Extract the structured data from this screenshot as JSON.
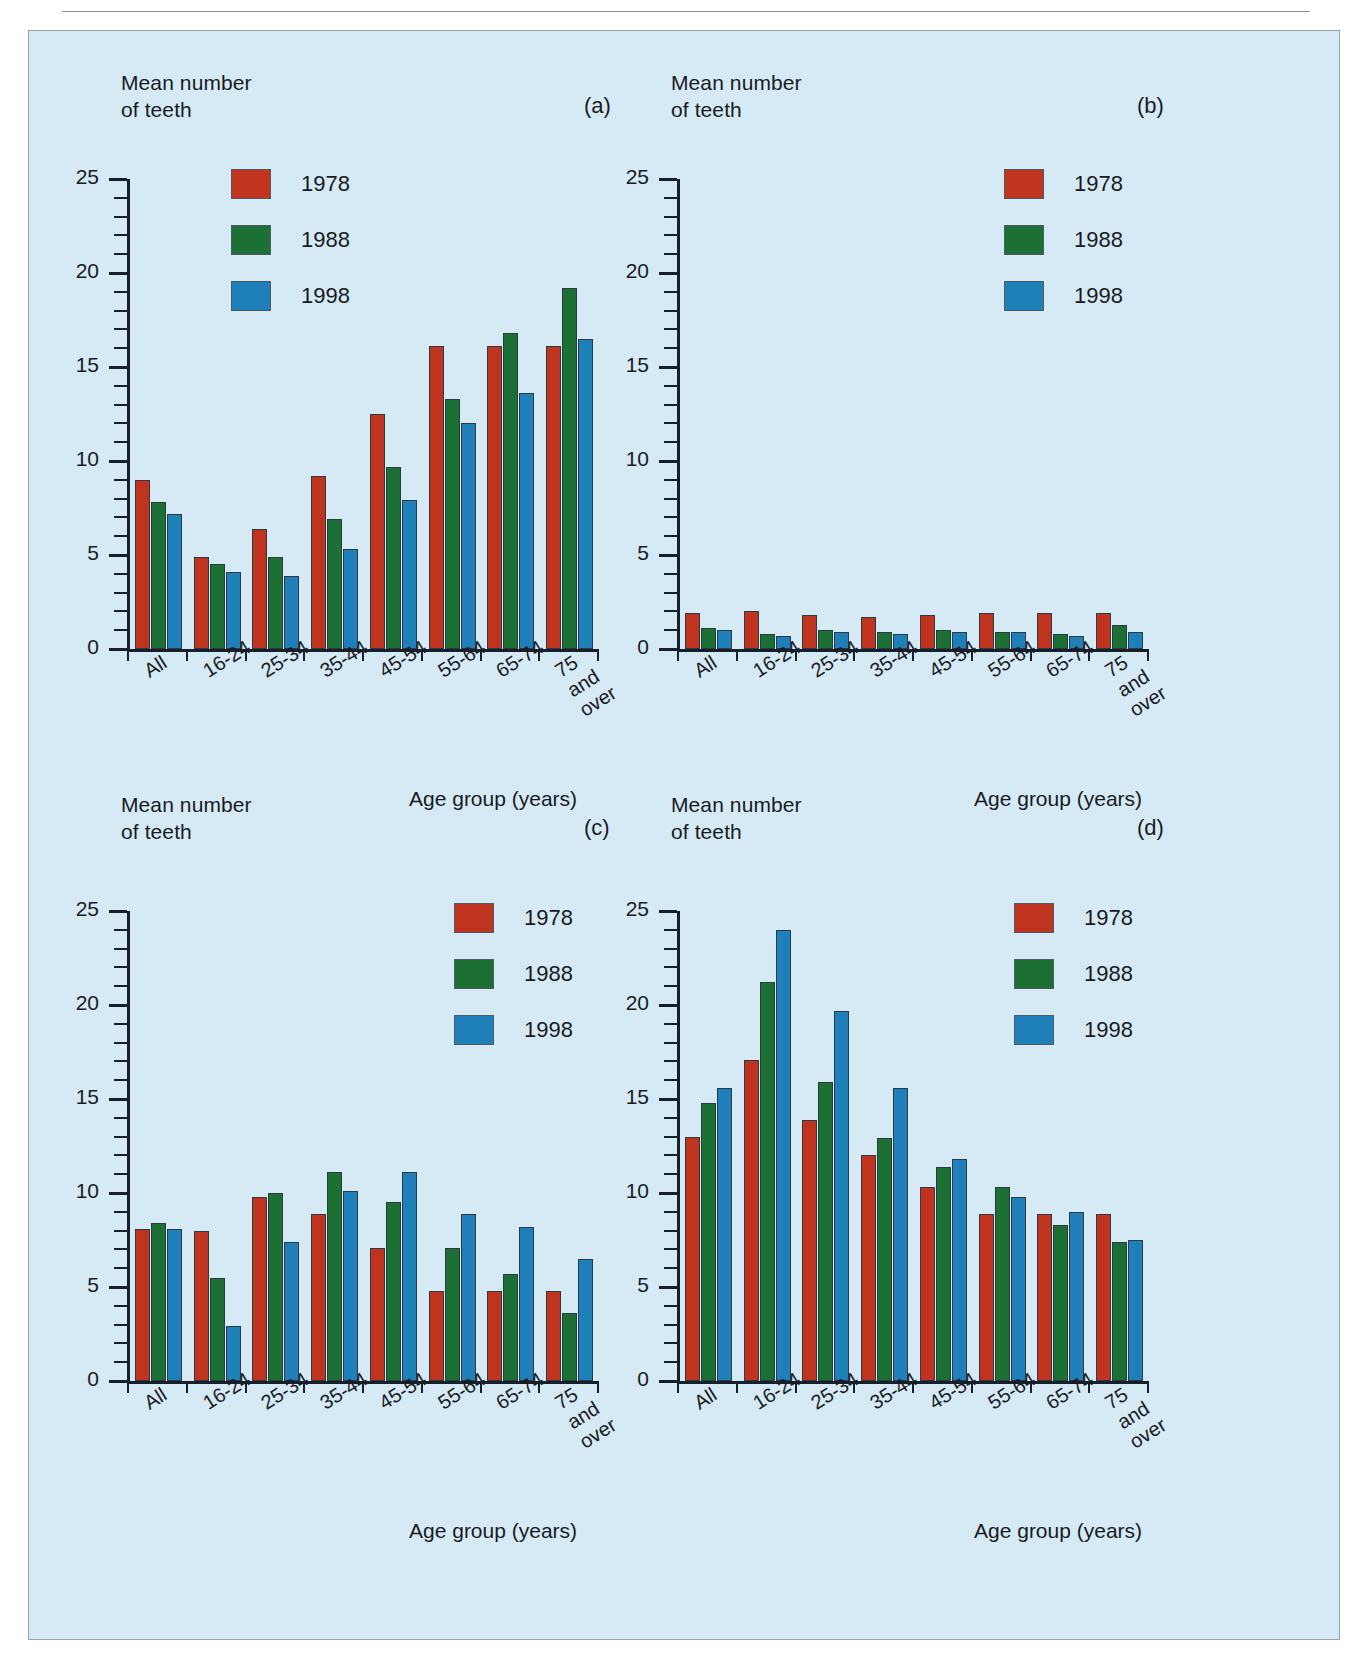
{
  "figure": {
    "background_color": "#d5eaf5",
    "series_colors": {
      "1978": "#c0331f",
      "1988": "#1d7034",
      "1998": "#1f7fb8"
    },
    "y_axis_title": "Mean number\nof teeth",
    "x_axis_title": "Age group (years)",
    "y_ticks": [
      "0",
      "5",
      "10",
      "15",
      "20",
      "25"
    ],
    "categories": [
      "All",
      "16-24",
      "25-34",
      "35-44",
      "45-54",
      "55-64",
      "65-74",
      "75 and\nover"
    ],
    "legend": [
      {
        "label": "1978",
        "color": "#c0331f"
      },
      {
        "label": "1988",
        "color": "#1d7034"
      },
      {
        "label": "1998",
        "color": "#1f7fb8"
      }
    ]
  },
  "chart_data": [
    {
      "type": "bar",
      "panel": "(a)",
      "title": "",
      "xlabel": "Age group (years)",
      "ylabel": "Mean number of teeth",
      "ylim": [
        0,
        25
      ],
      "yticks": [
        0,
        5,
        10,
        15,
        20,
        25
      ],
      "grid": false,
      "legend_position": "upper-left",
      "categories": [
        "All",
        "16-24",
        "25-34",
        "35-44",
        "45-54",
        "55-64",
        "65-74",
        "75 and over"
      ],
      "series": [
        {
          "name": "1978",
          "values": [
            9.0,
            4.9,
            6.4,
            9.2,
            12.5,
            16.1,
            16.1,
            16.1
          ]
        },
        {
          "name": "1988",
          "values": [
            7.8,
            4.5,
            4.9,
            6.9,
            9.7,
            13.3,
            16.8,
            19.2
          ]
        },
        {
          "name": "1998",
          "values": [
            7.2,
            4.1,
            3.9,
            5.3,
            7.9,
            12.0,
            13.6,
            16.5
          ]
        }
      ]
    },
    {
      "type": "bar",
      "panel": "(b)",
      "title": "",
      "xlabel": "Age group (years)",
      "ylabel": "Mean number of teeth",
      "ylim": [
        0,
        25
      ],
      "yticks": [
        0,
        5,
        10,
        15,
        20,
        25
      ],
      "grid": false,
      "legend_position": "upper-right",
      "categories": [
        "All",
        "16-24",
        "25-34",
        "35-44",
        "45-54",
        "55-64",
        "65-74",
        "75 and over"
      ],
      "series": [
        {
          "name": "1978",
          "values": [
            1.9,
            2.0,
            1.8,
            1.7,
            1.8,
            1.9,
            1.9,
            1.9
          ]
        },
        {
          "name": "1988",
          "values": [
            1.1,
            0.8,
            1.0,
            0.9,
            1.0,
            0.9,
            0.8,
            1.3
          ]
        },
        {
          "name": "1998",
          "values": [
            1.0,
            0.7,
            0.9,
            0.8,
            0.9,
            0.9,
            0.7,
            0.9
          ]
        }
      ]
    },
    {
      "type": "bar",
      "panel": "(c)",
      "title": "",
      "xlabel": "Age group (years)",
      "ylabel": "Mean number of teeth",
      "ylim": [
        0,
        25
      ],
      "yticks": [
        0,
        5,
        10,
        15,
        20,
        25
      ],
      "grid": false,
      "legend_position": "upper-right",
      "categories": [
        "All",
        "16-24",
        "25-34",
        "35-44",
        "45-54",
        "55-64",
        "65-74",
        "75 and over"
      ],
      "series": [
        {
          "name": "1978",
          "values": [
            8.1,
            8.0,
            9.8,
            8.9,
            7.1,
            4.8,
            4.8,
            4.8
          ]
        },
        {
          "name": "1988",
          "values": [
            8.4,
            5.5,
            10.0,
            11.1,
            9.5,
            7.1,
            5.7,
            3.6
          ]
        },
        {
          "name": "1998",
          "values": [
            8.1,
            2.9,
            7.4,
            10.1,
            11.1,
            8.9,
            8.2,
            6.5
          ]
        }
      ]
    },
    {
      "type": "bar",
      "panel": "(d)",
      "title": "",
      "xlabel": "Age group (years)",
      "ylabel": "Mean number of teeth",
      "ylim": [
        0,
        25
      ],
      "yticks": [
        0,
        5,
        10,
        15,
        20,
        25
      ],
      "grid": false,
      "legend_position": "upper-right",
      "categories": [
        "All",
        "16-24",
        "25-34",
        "35-44",
        "45-54",
        "55-64",
        "65-74",
        "75 and over"
      ],
      "series": [
        {
          "name": "1978",
          "values": [
            13.0,
            17.1,
            13.9,
            12.0,
            10.3,
            8.9,
            8.9,
            8.9
          ]
        },
        {
          "name": "1988",
          "values": [
            14.8,
            21.2,
            15.9,
            12.9,
            11.4,
            10.3,
            8.3,
            7.4
          ]
        },
        {
          "name": "1998",
          "values": [
            15.6,
            24.0,
            19.7,
            15.6,
            11.8,
            9.8,
            9.0,
            7.5
          ]
        }
      ]
    }
  ]
}
